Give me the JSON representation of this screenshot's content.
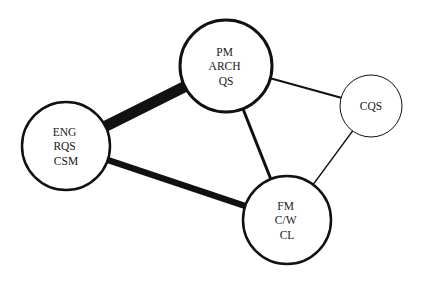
{
  "diagram": {
    "type": "network",
    "background": "#ffffff",
    "stroke_color": "#111111",
    "nodes": [
      {
        "id": "pm",
        "lines": [
          "PM",
          "ARCH",
          "QS"
        ],
        "cx": 226,
        "cy": 66,
        "r": 46,
        "stroke_width": 3
      },
      {
        "id": "eng",
        "lines": [
          "ENG",
          "RQS",
          "CSM"
        ],
        "cx": 66,
        "cy": 146,
        "r": 44,
        "stroke_width": 2.5
      },
      {
        "id": "fm",
        "lines": [
          "FM",
          "C/W",
          "CL"
        ],
        "cx": 287,
        "cy": 220,
        "r": 44,
        "stroke_width": 2.5
      },
      {
        "id": "cqs",
        "lines": [
          "CQS"
        ],
        "cx": 371,
        "cy": 106,
        "r": 31,
        "stroke_width": 1
      }
    ],
    "edges": [
      {
        "from": "eng",
        "to": "pm",
        "weight": "very strong",
        "width": 11
      },
      {
        "from": "eng",
        "to": "fm",
        "weight": "strong",
        "width": 6.5
      },
      {
        "from": "pm",
        "to": "fm",
        "weight": "medium",
        "width": 3
      },
      {
        "from": "pm",
        "to": "cqs",
        "weight": "weak",
        "width": 2
      },
      {
        "from": "cqs",
        "to": "fm",
        "weight": "weakest",
        "width": 1.3
      }
    ]
  }
}
